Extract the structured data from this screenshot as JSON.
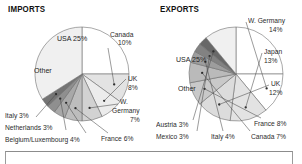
{
  "imports": {
    "title": "IMPORTS",
    "inner_labels": {
      "usa": "USA 25%",
      "other": "Other"
    },
    "callouts": {
      "canada": "Canada\n10%",
      "canada_l1": "Canada",
      "canada_l2": "10%",
      "uk_l1": "UK",
      "uk_l2": "8%",
      "wg_l1": "W.",
      "wg_l2": "Germany",
      "wg_l3": "7%",
      "france": "France 6%",
      "belgium": "Belgium/Luxembourg 4%",
      "netherlands": "Netherlands 3%",
      "italy": "Italy 3%"
    }
  },
  "exports": {
    "title": "EXPORTS",
    "inner_labels": {
      "usa": "USA 25%",
      "other": "Other"
    },
    "callouts": {
      "wgermany_l1": "W. Germany",
      "wgermany_l2": "14%",
      "japan_l1": "Japan",
      "japan_l2": "13%",
      "uk_l1": "UK",
      "uk_l2": "12%",
      "france": "France 8%",
      "canada": "Canada 7%",
      "italy": "Italy 4%",
      "mexico": "Mexico 3%",
      "austria": "Austria 3%"
    }
  },
  "chart_data": [
    {
      "type": "pie",
      "title": "IMPORTS",
      "categories": [
        "USA",
        "Canada",
        "UK",
        "W. Germany",
        "France",
        "Belgium/Luxembourg",
        "Netherlands",
        "Italy",
        "Other"
      ],
      "values": [
        25,
        10,
        8,
        7,
        6,
        4,
        3,
        3,
        34
      ],
      "labels": [
        "USA 25%",
        "Canada 10%",
        "UK 8%",
        "W. Germany 7%",
        "France 6%",
        "Belgium/Luxembourg 4%",
        "Netherlands 3%",
        "Italy 3%",
        "Other"
      ],
      "unit": "percent",
      "legend": "callouts",
      "colors": [
        "#ffffff",
        "#e3e3e3",
        "#ececec",
        "#d2d2d2",
        "#bdbdbd",
        "#a8a8a8",
        "#8f8f8f",
        "#747474",
        "#f0f0f0"
      ]
    },
    {
      "type": "pie",
      "title": "EXPORTS",
      "categories": [
        "USA",
        "W. Germany",
        "Japan",
        "UK",
        "France",
        "Canada",
        "Italy",
        "Mexico",
        "Austria",
        "Other"
      ],
      "values": [
        25,
        14,
        13,
        12,
        8,
        7,
        4,
        3,
        3,
        11
      ],
      "labels": [
        "USA 25%",
        "W. Germany 14%",
        "Japan 13%",
        "UK 12%",
        "France 8%",
        "Canada 7%",
        "Italy 4%",
        "Mexico 3%",
        "Austria 3%",
        "Other"
      ],
      "unit": "percent",
      "legend": "callouts",
      "colors": [
        "#ffffff",
        "#ffffff",
        "#e3e3e3",
        "#dcdcdc",
        "#c9c9c9",
        "#bababa",
        "#9d9d9d",
        "#828282",
        "#686868",
        "#f0f0f0"
      ]
    }
  ]
}
